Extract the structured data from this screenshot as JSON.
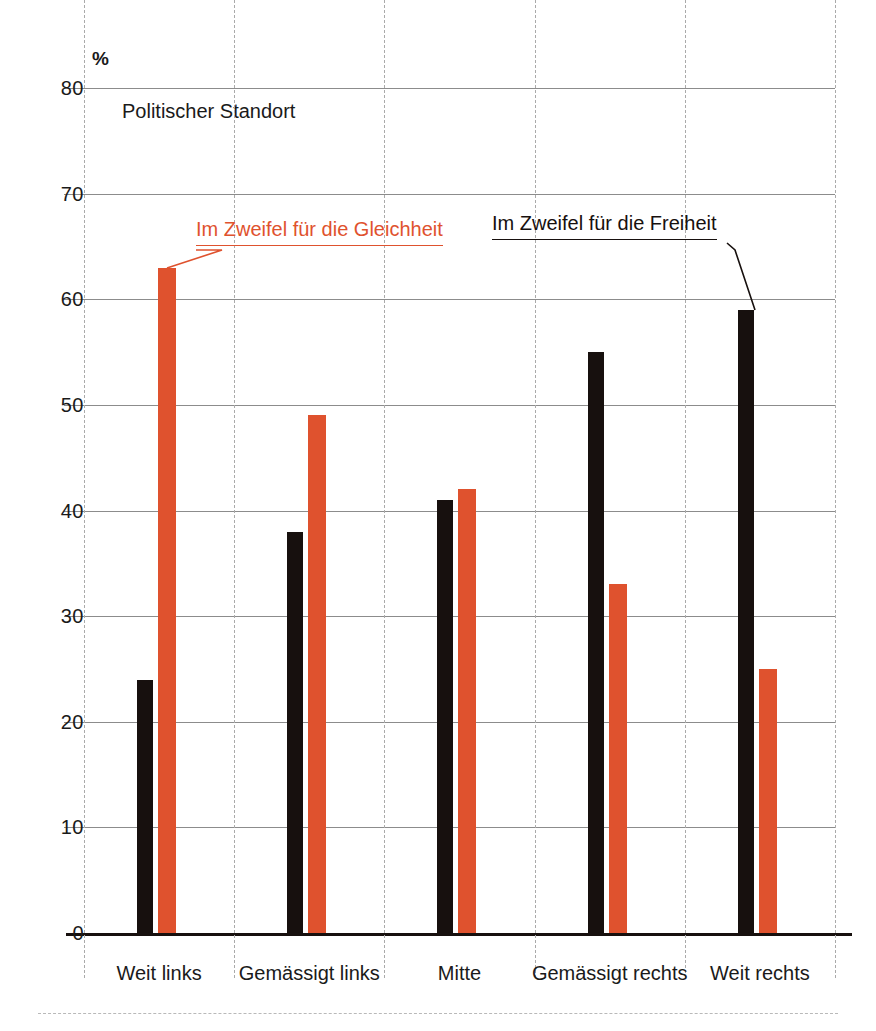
{
  "chart_data": {
    "type": "bar",
    "title": "Politischer Standort",
    "unit_label": "%",
    "xlabel": "",
    "ylabel": "%",
    "ylim": [
      0,
      80
    ],
    "yticks": [
      0,
      10,
      20,
      30,
      40,
      50,
      60,
      70,
      80
    ],
    "grid": true,
    "legend_position": "in-plot-callouts",
    "categories": [
      "Weit links",
      "Gemässigt links",
      "Mitte",
      "Gemässigt rechts",
      "Weit rechts"
    ],
    "series": [
      {
        "name": "Im Zweifel für die Freiheit",
        "color": "#17100e",
        "values": [
          24,
          38,
          41,
          55,
          59
        ]
      },
      {
        "name": "Im Zweifel für die Gleichheit",
        "color": "#df522e",
        "values": [
          63,
          49,
          42,
          33,
          25
        ]
      }
    ],
    "annotations": [
      {
        "id": "callout-equality",
        "text": "Im Zweifel für die Gleichheit",
        "color": "#df522e",
        "points_to": "series-gleichheit-bar-weit-links"
      },
      {
        "id": "callout-freedom",
        "text": "Im Zweifel für die Freiheit",
        "color": "#17100e",
        "points_to": "series-freiheit-bar-weit-rechts"
      }
    ]
  },
  "ytick_labels": [
    "80",
    "70",
    "60",
    "50",
    "40",
    "30",
    "20",
    "10",
    "0"
  ],
  "colors": {
    "accent": "#df522e",
    "dark": "#17100e",
    "grid": "#8c8c8c",
    "dash": "#aaaaaa",
    "background": "#ffffff"
  }
}
